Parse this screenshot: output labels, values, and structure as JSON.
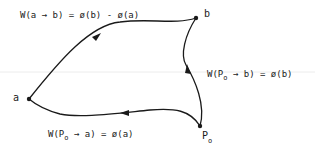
{
  "points": {
    "a": {
      "label": "a"
    },
    "b": {
      "label": "b"
    },
    "p0": {
      "label": "P",
      "subscript": "o"
    }
  },
  "equations": {
    "top": "W(a → b) = ø(b) - ø(a)",
    "right_prefix": "W(P",
    "right_sub": "o",
    "right_suffix": " → b) = ø(b)",
    "bottom_prefix": "W(P",
    "bottom_sub": "o",
    "bottom_suffix": " → a) = ø(a)"
  },
  "paths": [
    {
      "from": "a",
      "to": "b",
      "arrow": "mid"
    },
    {
      "from": "p0",
      "to": "b",
      "arrow": "mid"
    },
    {
      "from": "p0",
      "to": "a",
      "arrow": "mid"
    }
  ],
  "colors": {
    "ink": "#1a1a1a",
    "scanline": "#e6e6e6"
  }
}
